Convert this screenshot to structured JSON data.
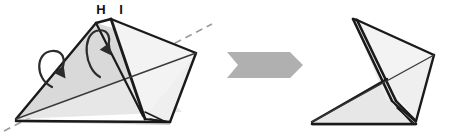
{
  "diagram": {
    "type": "origami-fold-step",
    "canvas": {
      "width": 456,
      "height": 138,
      "background": "#ffffff"
    },
    "labels": [
      {
        "id": "H",
        "text": "H",
        "x": 101,
        "y": 14
      },
      {
        "id": "I",
        "text": "I",
        "x": 121,
        "y": 14
      }
    ],
    "colors": {
      "outline": "#1a1a1a",
      "fold_line": "#3a3a3a",
      "fill_light": "#f3f3f3",
      "fill_mid": "#e7e7e7",
      "fill_dark": "#d9d9d9",
      "fill_shadow": "#cfcfcf",
      "arrow_gray": "#b0b0b0",
      "dashed_line": "#9a9a9a",
      "motion_arrow": "#2b2b2b",
      "label_color": "#111111",
      "background": "#ffffff"
    },
    "left_figure": {
      "name": "before-fold",
      "panels": [
        {
          "name": "lower-large-panel",
          "fill": "#e7e7e7",
          "points": "16,119 96,23 182,112 16,119"
        },
        {
          "name": "upper-left-panel",
          "fill": "#d9d9d9",
          "points": "16,119 96,23 196,53 16,119"
        },
        {
          "name": "right-upper-panel",
          "fill": "#f3f3f3",
          "points": "111,19 196,53 145,119 111,19"
        },
        {
          "name": "right-lower-panel",
          "fill": "#efefef",
          "points": "196,53 145,119 170,122 196,53"
        },
        {
          "name": "bottom-strip",
          "fill": "#cfcfcf",
          "points": "16,119 170,122 170,125 16,122"
        }
      ],
      "edges": [
        {
          "name": "left-outer-edge",
          "points": "16,119 96,23",
          "width": 2.4
        },
        {
          "name": "spine-edge",
          "points": "96,23 111,19",
          "width": 2.4
        },
        {
          "name": "top-right-edge",
          "points": "111,19 196,53",
          "width": 2.4
        },
        {
          "name": "right-slant-edge",
          "points": "196,53 170,122",
          "width": 2.4
        },
        {
          "name": "bottom-edge",
          "points": "16,121 170,122",
          "width": 2.6
        },
        {
          "name": "inner-fold-edge",
          "points": "111,19 145,119",
          "width": 2.8
        },
        {
          "name": "crease-diagonal",
          "points": "16,119 196,53",
          "width": 1.4
        },
        {
          "name": "second-spine",
          "points": "96,23 143,116",
          "width": 2.2
        }
      ],
      "flap_detail": {
        "name": "bottom-flap",
        "lines": [
          "145,119 170,122",
          "145,112 166,122",
          "150,119 168,122"
        ]
      },
      "dashed_axis": {
        "name": "fold-axis-dashed",
        "points": "4,131 212,24",
        "dash": "7 5"
      },
      "motion_arrows": [
        {
          "name": "outer-fold-arrow",
          "path": "M 52,87 C 34,78 36,52 52,51 C 66,50 66,66 60,71",
          "tip": "60,71"
        },
        {
          "name": "inner-fold-arrow",
          "path": "M 100,77 C 84,68 82,36 96,31 C 110,27 112,42 106,48",
          "tip": "106,48"
        }
      ]
    },
    "process_arrow": {
      "name": "transition-arrow",
      "direction": "right",
      "fill": "#b0b0b0",
      "points": "227,52 290,52 303,65 290,78 227,78 238,65 227,52"
    },
    "right_figure": {
      "name": "after-fold",
      "panels": [
        {
          "name": "lower-large-panel",
          "fill": "#e7e7e7",
          "points": "312,123 383,79 416,123 312,123"
        },
        {
          "name": "upper-panel",
          "fill": "#f3f3f3",
          "points": "357,20 434,55 383,79 357,20"
        },
        {
          "name": "mid-panel",
          "fill": "#efefef",
          "points": "383,79 434,55 416,120 383,79"
        },
        {
          "name": "left-sliver",
          "fill": "#ededed",
          "points": "353,19 357,20 392,101 387,101 353,19"
        },
        {
          "name": "bottom-strip",
          "fill": "#cfcfcf",
          "points": "312,123 416,123 416,126 312,126"
        }
      ],
      "edges": [
        {
          "name": "spine-outer",
          "points": "353,19 392,101",
          "width": 2.6
        },
        {
          "name": "spine-inner",
          "points": "357,20 396,101",
          "width": 2.6
        },
        {
          "name": "spine-top",
          "points": "353,19 357,20",
          "width": 2.4
        },
        {
          "name": "top-right-edge",
          "points": "357,20 434,55",
          "width": 2.4
        },
        {
          "name": "right-slant-edge",
          "points": "434,55 416,121",
          "width": 2.4
        },
        {
          "name": "left-lower-edge",
          "points": "312,122 387,79",
          "width": 2.4
        },
        {
          "name": "bottom-edge",
          "points": "312,124 416,124",
          "width": 2.6
        },
        {
          "name": "crease-diagonal",
          "points": "312,122 434,55",
          "width": 1.4
        },
        {
          "name": "inner-fold-edge",
          "points": "396,101 416,121",
          "width": 2.4
        }
      ],
      "flap_detail": {
        "name": "bottom-flap",
        "lines": [
          "392,101 416,122",
          "392,101 412,123",
          "397,108 414,123"
        ]
      }
    }
  }
}
